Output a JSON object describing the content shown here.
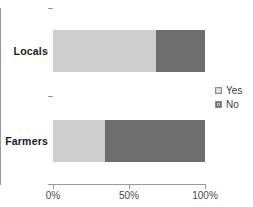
{
  "chart_data": {
    "type": "bar",
    "orientation": "horizontal",
    "stacked": true,
    "stack_total": 100,
    "title": "",
    "subtitle": "",
    "xlabel": "",
    "ylabel": "",
    "categories": [
      "Locals",
      "Farmers"
    ],
    "series": [
      {
        "name": "Yes",
        "color": "#cfcfcf",
        "values": [
          68,
          34
        ]
      },
      {
        "name": "No",
        "color": "#6e6e6e",
        "values": [
          32,
          66
        ]
      }
    ],
    "xlim": [
      0,
      100
    ],
    "x_ticks": [
      0,
      50,
      100
    ],
    "x_tick_labels": [
      "0%",
      "50%",
      "100%"
    ],
    "grid": false,
    "legend_position": "right",
    "legend_entries": [
      "Yes",
      "No"
    ]
  },
  "axis": {
    "x_tick_labels": {
      "zero": "0%",
      "fifty": "50%",
      "hundred": "100%"
    },
    "axis_color": "#9a9a9a"
  },
  "categories": {
    "locals": "Locals",
    "farmers": "Farmers"
  },
  "legend": {
    "items": [
      {
        "label": "Yes",
        "color": "#cfcfcf"
      },
      {
        "label": "No",
        "color": "#6e6e6e"
      }
    ]
  },
  "colors": {
    "yes": "#cfcfcf",
    "no": "#6e6e6e",
    "axis": "#9a9a9a",
    "category_text": "#1a1a1a",
    "tick_text": "#4a4a4a",
    "background": "#ffffff"
  }
}
